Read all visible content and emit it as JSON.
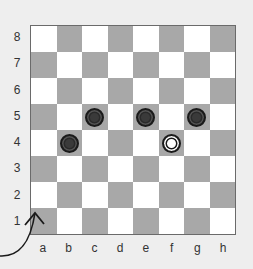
{
  "board": {
    "files": [
      "a",
      "b",
      "c",
      "d",
      "e",
      "f",
      "g",
      "h"
    ],
    "ranks": [
      "8",
      "7",
      "6",
      "5",
      "4",
      "3",
      "2",
      "1"
    ],
    "colors": {
      "dark_square": "#a8a8a8",
      "light_square": "#ffffff",
      "black_piece": "#3a3a3a",
      "white_piece": "#ffffff"
    },
    "pieces": [
      {
        "square": "c5",
        "color": "black"
      },
      {
        "square": "e5",
        "color": "black"
      },
      {
        "square": "g5",
        "color": "black"
      },
      {
        "square": "b4",
        "color": "black"
      },
      {
        "square": "f4",
        "color": "white"
      }
    ],
    "annotation": {
      "type": "curved-arrow",
      "target_square": "a1"
    }
  }
}
